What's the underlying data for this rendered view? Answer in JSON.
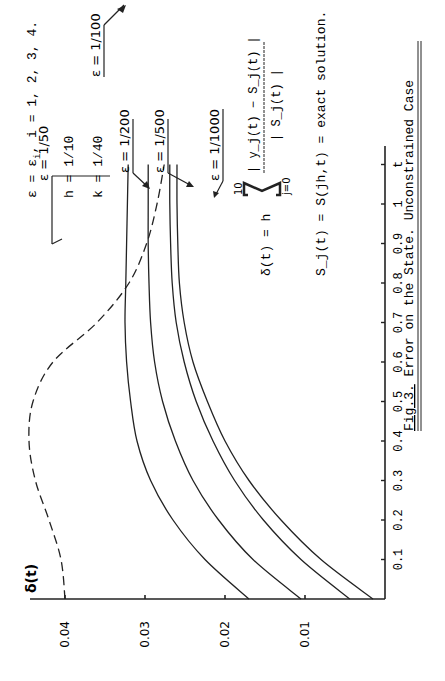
{
  "chart_data": {
    "type": "line",
    "orientation": "rotated-90-ccw",
    "title": "Fig.3. Error on the State. Unconstrained Case",
    "xlabel": "t",
    "ylabel": "δ(t)",
    "xlim": [
      0,
      1.1
    ],
    "ylim": [
      0,
      0.045
    ],
    "x_ticks": [
      "0.1",
      "0.2",
      "0.3",
      "0.4",
      "0.5",
      "0.6",
      "0.7",
      "0.8",
      "0.9",
      "1",
      "t"
    ],
    "y_ticks": [
      "0.01",
      "0.02",
      "0.03",
      "0.04"
    ],
    "grid": false,
    "x": [
      0,
      0.1,
      0.2,
      0.3,
      0.4,
      0.5,
      0.6,
      0.7,
      0.8,
      0.9,
      1.0,
      1.1
    ],
    "series": [
      {
        "name": "ε = 1/50",
        "style": "dashed",
        "values": [
          0.04,
          0.0405,
          0.042,
          0.0437,
          0.0445,
          0.044,
          0.0415,
          0.036,
          0.032,
          0.0298,
          0.0285,
          0.0276
        ]
      },
      {
        "name": "ε = 1/100",
        "style": "solid",
        "values": [
          0.017,
          0.0225,
          0.0265,
          0.0293,
          0.031,
          0.0318,
          0.0323,
          0.0325,
          0.0324,
          0.0323,
          0.0322,
          0.0321
        ]
      },
      {
        "name": "ε = 1/200",
        "style": "solid",
        "values": [
          0.0105,
          0.0165,
          0.0208,
          0.024,
          0.0262,
          0.0278,
          0.0288,
          0.0293,
          0.0295,
          0.0296,
          0.0296,
          0.0296
        ]
      },
      {
        "name": "ε = 1/500",
        "style": "solid",
        "values": [
          0.0044,
          0.0105,
          0.0152,
          0.0188,
          0.0215,
          0.0236,
          0.0251,
          0.0261,
          0.0266,
          0.0268,
          0.0269,
          0.0269
        ]
      },
      {
        "name": "ε = 1/1000",
        "style": "solid",
        "values": [
          0.0015,
          0.008,
          0.013,
          0.017,
          0.02,
          0.0222,
          0.024,
          0.0251,
          0.0257,
          0.0259,
          0.026,
          0.026
        ]
      }
    ],
    "annotations": [
      "ε = ε_i, i = 1, 2, 3, 4.",
      "h = 1/10",
      "k = 1/40",
      "δ(t) = h Σ_{j=0}^{10} |y_j(t) − S_j(t)| / |S_j(t)|",
      "S_j(t) = S(jh,t) = exact solution."
    ]
  },
  "labels": {
    "eps50": "ε = 1/50",
    "eps100": "ε = 1/100",
    "eps200": "ε = 1/200",
    "eps500": "ε = 1/500",
    "eps1000": "ε = 1/1000",
    "ylabel": "δ(t)",
    "xlabel": "t",
    "caption_fig": "Fig.3.",
    "caption_rest": " Error on the State. Unconstrained Case"
  },
  "params": {
    "eps_def": "ε  =  ε",
    "eps_sub": "i",
    "eps_rest": ", i = 1, 2, 3, 4.",
    "h": "h  =  1/10",
    "k": "k  =  1/40"
  },
  "formula": {
    "lhs": "δ(t)  =  h",
    "sum_top": "10",
    "sum_bottom": "j=0",
    "numerator": "| y_j(t) − S_j(t) |",
    "denominator": "| S_j(t) |",
    "exact_lhs": "S_j(t)  =  S(jh,t)  =  exact solution."
  }
}
